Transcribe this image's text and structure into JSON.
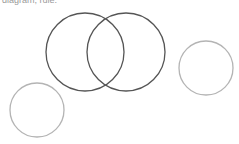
{
  "caption": "diagram, rule:",
  "colors": {
    "dark_circle": "#555555",
    "light_circle": "#b4b4b4"
  },
  "circles": [
    {
      "id": "venn-left",
      "cx": 85,
      "cy": 52,
      "r": 39,
      "style": "dark"
    },
    {
      "id": "venn-right",
      "cx": 126,
      "cy": 52,
      "r": 39,
      "style": "dark"
    },
    {
      "id": "small-right",
      "cx": 206,
      "cy": 68,
      "r": 27,
      "style": "light"
    },
    {
      "id": "small-left",
      "cx": 37,
      "cy": 110,
      "r": 27,
      "style": "light"
    }
  ]
}
